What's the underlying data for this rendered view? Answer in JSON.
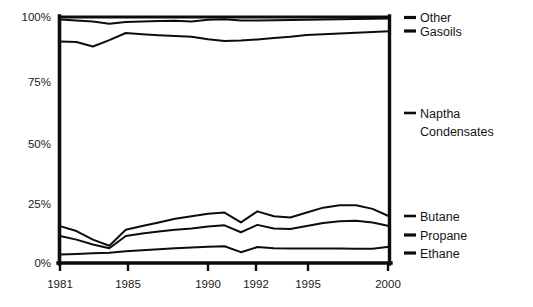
{
  "chart_data": {
    "type": "line",
    "title": "",
    "subtitle": "",
    "xlabel": "",
    "ylabel": "",
    "xlim": [
      1980,
      2000
    ],
    "ylim": [
      0,
      100
    ],
    "grid": false,
    "legend_position": "right",
    "y_ticks": [
      "0%",
      "25%",
      "50%",
      "75%",
      "100%"
    ],
    "y_tick_values": [
      0,
      25,
      50,
      75,
      100
    ],
    "x_ticks": [
      "1981",
      "1985",
      "1990",
      "1992",
      "1995",
      "2000"
    ],
    "x_tick_values": [
      1981,
      1985,
      1990,
      1992,
      1995,
      2000
    ],
    "x": [
      1980,
      1981,
      1982,
      1983,
      1984,
      1985,
      1986,
      1987,
      1988,
      1989,
      1990,
      1991,
      1992,
      1993,
      1994,
      1995,
      1996,
      1997,
      1998,
      1999,
      2000
    ],
    "series": [
      {
        "name": "Other",
        "values": [
          100,
          100,
          100,
          100,
          100,
          100,
          100,
          100,
          100,
          100,
          100,
          100,
          100,
          100,
          100,
          100,
          100,
          100,
          100,
          100,
          100
        ]
      },
      {
        "name": "Gasoils",
        "values": [
          99.0,
          98.6,
          98.2,
          97.3,
          98.0,
          98.2,
          98.4,
          98.5,
          98.2,
          98.9,
          99.1,
          98.6,
          98.6,
          98.7,
          98.8,
          98.9,
          99.0,
          99.1,
          99.2,
          99.3,
          99.4
        ]
      },
      {
        "name": "Naptha Condensates",
        "values": [
          90.0,
          89.8,
          88.0,
          90.6,
          93.5,
          93.0,
          92.6,
          92.3,
          92.0,
          91.0,
          90.2,
          90.4,
          90.9,
          91.5,
          92.0,
          92.7,
          93.0,
          93.3,
          93.6,
          93.9,
          94.2
        ]
      },
      {
        "name": "Butane",
        "values": [
          15.0,
          13.0,
          9.5,
          7.0,
          13.5,
          15.0,
          16.5,
          18.0,
          19.0,
          20.0,
          20.5,
          16.5,
          21.0,
          19.0,
          18.5,
          20.5,
          22.5,
          23.5,
          23.5,
          22.0,
          19.0
        ]
      },
      {
        "name": "Propane",
        "values": [
          11.0,
          9.5,
          7.5,
          6.0,
          11.0,
          12.0,
          12.8,
          13.5,
          14.0,
          14.8,
          15.3,
          12.5,
          15.5,
          14.0,
          13.8,
          15.0,
          16.3,
          17.0,
          17.2,
          16.5,
          15.0
        ]
      },
      {
        "name": "Ethane",
        "values": [
          3.5,
          3.7,
          4.0,
          4.2,
          4.8,
          5.2,
          5.6,
          6.0,
          6.3,
          6.6,
          6.8,
          4.4,
          6.5,
          6.0,
          5.9,
          5.9,
          5.9,
          5.9,
          5.8,
          5.8,
          6.6
        ]
      }
    ]
  },
  "legend": {
    "items": [
      {
        "label": "Other"
      },
      {
        "label": "Gasoils"
      },
      {
        "label": "Naptha"
      },
      {
        "label": "Condensates"
      },
      {
        "label": "Butane"
      },
      {
        "label": "Propane"
      },
      {
        "label": "Ethane"
      }
    ]
  },
  "colors": {
    "line": "#0d0d0d",
    "text": "#151515",
    "background": "#ffffff"
  }
}
